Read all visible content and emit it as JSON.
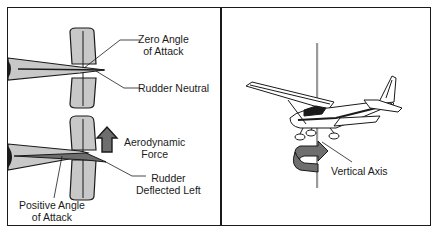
{
  "left_panel": {
    "labels": {
      "zero_angle_line1": "Zero Angle",
      "zero_angle_line2": "of Attack",
      "rudder_neutral": "Rudder Neutral",
      "aero_force_line1": "Aerodynamic",
      "aero_force_line2": "Force",
      "rudder_deflected_line1": "Rudder",
      "rudder_deflected_line2": "Deflected Left",
      "positive_angle_line1": "Positive Angle",
      "positive_angle_line2": "of Attack"
    }
  },
  "right_panel": {
    "labels": {
      "vertical_axis": "Vertical Axis"
    }
  },
  "colors": {
    "line": "#1a1a1a",
    "fin_fill": "#c8c8c8",
    "dark_fill": "#6e6e6e",
    "rod": "#9a9a9a",
    "background": "#ffffff"
  }
}
